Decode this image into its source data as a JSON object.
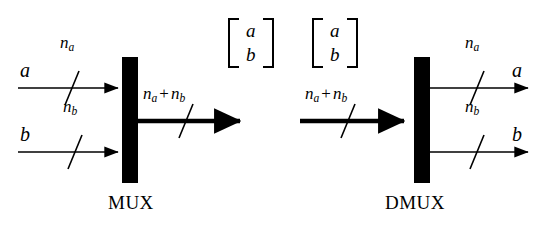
{
  "figure": {
    "background_color": "#ffffff",
    "ink_color": "#000000",
    "width": 545,
    "height": 233
  },
  "mux": {
    "block_label": "MUX",
    "bar": {
      "x": 122,
      "y": 57,
      "width": 16,
      "height": 126
    },
    "inputs": [
      {
        "signal_label": "a",
        "width_label_base": "n",
        "width_label_sub": "a",
        "line": {
          "x1": 18,
          "y1": 88,
          "x2": 120,
          "y2": 88
        },
        "tick": {
          "x": 72,
          "y": 88
        },
        "style": "thin"
      },
      {
        "signal_label": "b",
        "width_label_base": "n",
        "width_label_sub": "b",
        "line": {
          "x1": 18,
          "y1": 152,
          "x2": 120,
          "y2": 152
        },
        "tick": {
          "x": 75,
          "y": 152
        },
        "style": "thin"
      }
    ],
    "outputs": [
      {
        "signal_label": "",
        "width_label": "n_a + n_b",
        "width_label_parts": {
          "base1": "n",
          "sub1": "a",
          "op": "+",
          "base2": "n",
          "sub2": "b"
        },
        "line": {
          "x1": 138,
          "y1": 121,
          "x2": 250,
          "y2": 121
        },
        "tick": {
          "x": 186,
          "y": 121
        },
        "style": "thick"
      }
    ],
    "bus_matrix": {
      "rows": [
        "a",
        "b"
      ],
      "x": 228,
      "y": 18
    }
  },
  "dmux": {
    "block_label": "DMUX",
    "bar": {
      "x": 414,
      "y": 57,
      "width": 16,
      "height": 126
    },
    "inputs": [
      {
        "signal_label": "",
        "width_label": "n_a + n_b",
        "width_label_parts": {
          "base1": "n",
          "sub1": "a",
          "op": "+",
          "base2": "n",
          "sub2": "b"
        },
        "line": {
          "x1": 300,
          "y1": 121,
          "x2": 414,
          "y2": 121
        },
        "tick": {
          "x": 348,
          "y": 121
        },
        "style": "thick"
      }
    ],
    "outputs": [
      {
        "signal_label": "a",
        "width_label_base": "n",
        "width_label_sub": "a",
        "line": {
          "x1": 430,
          "y1": 88,
          "x2": 530,
          "y2": 88
        },
        "tick": {
          "x": 477,
          "y": 88
        },
        "style": "thin"
      },
      {
        "signal_label": "b",
        "width_label_base": "n",
        "width_label_sub": "b",
        "line": {
          "x1": 430,
          "y1": 152,
          "x2": 530,
          "y2": 152
        },
        "tick": {
          "x": 477,
          "y": 152
        },
        "style": "thin"
      }
    ],
    "bus_matrix": {
      "rows": [
        "a",
        "b"
      ],
      "x": 312,
      "y": 18
    }
  }
}
